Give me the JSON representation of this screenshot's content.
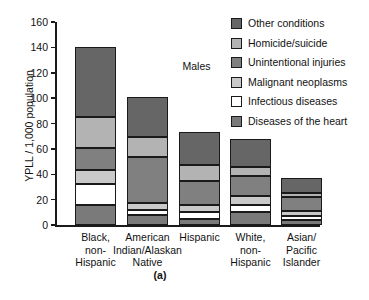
{
  "chart_data": {
    "type": "bar",
    "subtype": "stacked-bar",
    "title": "",
    "annotation": "Males",
    "caption": "(a)",
    "xlabel": "",
    "ylabel": "YPLL / 1,000 population",
    "ylim": [
      0,
      160
    ],
    "yticks": [
      0,
      20,
      40,
      60,
      80,
      100,
      120,
      140,
      160
    ],
    "grid": false,
    "legend_position": "upper-right",
    "categories": [
      "Black,\nnon-\nHispanic",
      "American\nIndian/Alaskan\nNative",
      "Hispanic",
      "White,\nnon-\nHispanic",
      "Asian/\nPacific\nIslander"
    ],
    "series": [
      {
        "name": "Diseases of the heart",
        "color": "#7a7a7a",
        "values": [
          16,
          8,
          5,
          10,
          4
        ]
      },
      {
        "name": "Infectious diseases",
        "color": "#ffffff",
        "values": [
          16,
          4,
          5,
          6,
          3
        ]
      },
      {
        "name": "Malignant neoplasms",
        "color": "#c9c9c9",
        "values": [
          11,
          5,
          6,
          7,
          4
        ]
      },
      {
        "name": "Unintentional injuries",
        "color": "#808080",
        "values": [
          18,
          37,
          19,
          16,
          11
        ]
      },
      {
        "name": "Homicide/suicide",
        "color": "#b3b3b3",
        "values": [
          24,
          15,
          12,
          7,
          3
        ]
      },
      {
        "name": "Other conditions",
        "color": "#666666",
        "values": [
          55,
          32,
          26,
          22,
          12
        ]
      }
    ],
    "totals": [
      140,
      101,
      73,
      68,
      37
    ]
  },
  "legend": {
    "items": [
      {
        "label": "Other conditions",
        "color": "#666666"
      },
      {
        "label": "Homicide/suicide",
        "color": "#b3b3b3"
      },
      {
        "label": "Unintentional injuries",
        "color": "#808080"
      },
      {
        "label": "Malignant neoplasms",
        "color": "#c9c9c9"
      },
      {
        "label": "Infectious diseases",
        "color": "#ffffff"
      },
      {
        "label": "Diseases of the heart",
        "color": "#7a7a7a"
      }
    ]
  },
  "colors": {
    "axis": "#1a1a1a",
    "background": "#ffffff",
    "text": "#111111"
  }
}
